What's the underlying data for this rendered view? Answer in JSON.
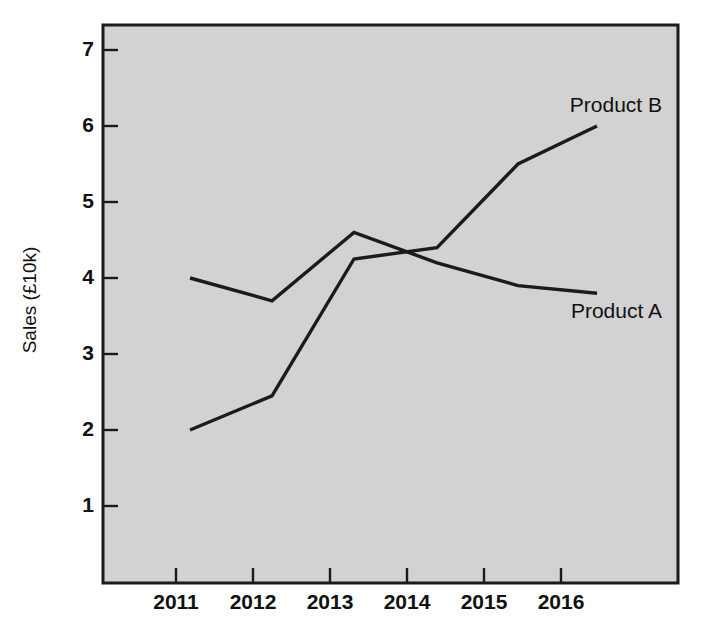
{
  "chart_data": {
    "type": "line",
    "title": "",
    "xlabel": "",
    "ylabel": "Sales (£10k)",
    "categories": [
      "2011",
      "2012",
      "2013",
      "2014",
      "2015",
      "2016"
    ],
    "x": [
      2011,
      2012,
      2013,
      2014,
      2015,
      2016
    ],
    "series": [
      {
        "name": "Product A",
        "label": "Product A",
        "values": [
          4.0,
          3.7,
          4.6,
          4.2,
          3.9,
          3.8
        ],
        "color": "#1b1b1b"
      },
      {
        "name": "Product B",
        "label": "Product B",
        "values": [
          2.0,
          2.45,
          4.25,
          4.4,
          5.5,
          6.0
        ],
        "color": "#1b1b1b"
      }
    ],
    "ylim": [
      0,
      7.35
    ],
    "yticks": [
      1,
      2,
      3,
      4,
      5,
      6,
      7
    ],
    "ytick_labels": [
      "1",
      "2",
      "3",
      "4",
      "5",
      "6",
      "7"
    ],
    "xtick_labels": [
      "2011",
      "2012",
      "2013",
      "2014",
      "2015",
      "2016"
    ],
    "grid": false,
    "legend_position": "inline-annotations",
    "plot_background_color": "#d2d2d2",
    "axis_color": "#1a1a1a",
    "annotations": [
      {
        "text": "Product B",
        "series": "Product B",
        "position": "above-right-end"
      },
      {
        "text": "Product A",
        "series": "Product A",
        "position": "below-right-end"
      }
    ]
  },
  "axis": {
    "y_title": "Sales (£10k)"
  }
}
